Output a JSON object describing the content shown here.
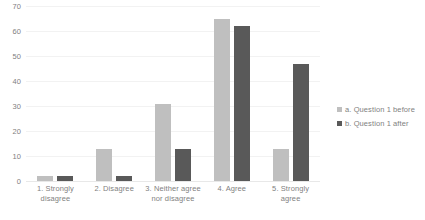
{
  "chart_data": {
    "type": "bar",
    "title": "",
    "xlabel": "",
    "ylabel": "",
    "ylim": [
      0,
      70
    ],
    "yticks": [
      0,
      10,
      20,
      30,
      40,
      50,
      60,
      70
    ],
    "grid": true,
    "legend_position": "right",
    "categories": [
      "1. Strongly disagree",
      "2. Disagree",
      "3. Neither agree nor disagree",
      "4. Agree",
      "5. Strongly agree"
    ],
    "series": [
      {
        "name": "a. Question 1 before",
        "color": "#bfbfbf",
        "values": [
          2,
          13,
          31,
          65,
          13
        ]
      },
      {
        "name": "b. Question 1 after",
        "color": "#595959",
        "values": [
          2,
          2,
          13,
          62,
          47
        ]
      }
    ]
  },
  "axis": {
    "y_tick_labels": [
      "70",
      "60",
      "50",
      "40",
      "30",
      "20",
      "10",
      "0"
    ],
    "x_tick_labels": [
      "1. Strongly disagree",
      "2. Disagree",
      "3. Neither agree nor disagree",
      "4. Agree",
      "5. Strongly agree"
    ]
  },
  "legend": {
    "items": [
      {
        "label": "a. Question 1 before",
        "color": "#bfbfbf"
      },
      {
        "label": "b. Question 1 after",
        "color": "#595959"
      }
    ]
  },
  "colors": {
    "before": "#bfbfbf",
    "after": "#595959",
    "text": "#7f7f7f",
    "gridline": "#f2f2f2",
    "background": "#ffffff"
  }
}
